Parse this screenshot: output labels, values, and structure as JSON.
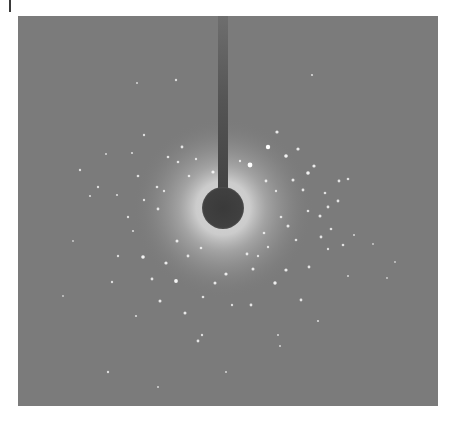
{
  "page": {
    "cropped_caption_fragment": "ᵍ  ʸ ᵍ ʸ ʸ     ᵍ     ᵍ"
  },
  "figure": {
    "type": "diffraction-pattern",
    "colors": {
      "background": "#7b7b7b",
      "halo": "#c8c8c8",
      "beamstop": "#3e3e3e",
      "spot": "#ffffff"
    },
    "beamstop": {
      "cx": 205,
      "cy": 192,
      "r": 20,
      "arm_x": 202,
      "arm_width": 10
    },
    "halo": {
      "inner_r": 22,
      "peak_r": 40,
      "outer_r": 85
    },
    "spots": [
      [
        232,
        149,
        2.4
      ],
      [
        250,
        131,
        2.2
      ],
      [
        268,
        140,
        1.8
      ],
      [
        259,
        116,
        1.6
      ],
      [
        280,
        133,
        1.6
      ],
      [
        290,
        157,
        1.8
      ],
      [
        296,
        150,
        1.6
      ],
      [
        275,
        164,
        1.5
      ],
      [
        188,
        199,
        1.5
      ],
      [
        195,
        156,
        1.6
      ],
      [
        140,
        193,
        1.4
      ],
      [
        126,
        184,
        1.2
      ],
      [
        120,
        160,
        1.3
      ],
      [
        139,
        171,
        1.3
      ],
      [
        146,
        175,
        1.2
      ],
      [
        150,
        141,
        1.3
      ],
      [
        164,
        131,
        1.4
      ],
      [
        171,
        160,
        1.3
      ],
      [
        178,
        143,
        1.2
      ],
      [
        125,
        241,
        1.8
      ],
      [
        148,
        247,
        1.6
      ],
      [
        158,
        265,
        1.9
      ],
      [
        134,
        263,
        1.4
      ],
      [
        142,
        285,
        1.5
      ],
      [
        167,
        297,
        1.5
      ],
      [
        180,
        325,
        1.4
      ],
      [
        197,
        267,
        1.5
      ],
      [
        208,
        258,
        1.6
      ],
      [
        213,
        199,
        1.4
      ],
      [
        235,
        253,
        1.5
      ],
      [
        233,
        289,
        1.4
      ],
      [
        257,
        267,
        1.7
      ],
      [
        268,
        254,
        1.6
      ],
      [
        291,
        251,
        1.4
      ],
      [
        283,
        284,
        1.4
      ],
      [
        302,
        200,
        1.5
      ],
      [
        310,
        191,
        1.4
      ],
      [
        320,
        185,
        1.4
      ],
      [
        303,
        221,
        1.4
      ],
      [
        313,
        213,
        1.3
      ],
      [
        285,
        174,
        1.4
      ],
      [
        290,
        195,
        1.3
      ],
      [
        307,
        177,
        1.3
      ],
      [
        321,
        165,
        1.4
      ],
      [
        330,
        163,
        1.3
      ],
      [
        310,
        233,
        1.2
      ],
      [
        325,
        229,
        1.3
      ],
      [
        270,
        210,
        1.5
      ],
      [
        263,
        201,
        1.3
      ],
      [
        278,
        224,
        1.3
      ],
      [
        62,
        154,
        1.2
      ],
      [
        80,
        171,
        1.2
      ],
      [
        99,
        179,
        1.1
      ],
      [
        72,
        180,
        1.1
      ],
      [
        114,
        137,
        1.1
      ],
      [
        126,
        119,
        1.2
      ],
      [
        207,
        40,
        1.0
      ],
      [
        119,
        67,
        1.0
      ],
      [
        158,
        64,
        1.2
      ],
      [
        294,
        59,
        1.1
      ],
      [
        110,
        201,
        1.2
      ],
      [
        115,
        215,
        1.1
      ],
      [
        100,
        240,
        1.2
      ],
      [
        94,
        266,
        1.2
      ],
      [
        118,
        300,
        1.1
      ],
      [
        90,
        356,
        1.2
      ],
      [
        140,
        371,
        1.0
      ],
      [
        184,
        319,
        1.2
      ],
      [
        208,
        356,
        1.0
      ],
      [
        262,
        330,
        1.0
      ],
      [
        300,
        305,
        1.1
      ],
      [
        260,
        319,
        1.0
      ],
      [
        336,
        219,
        1.0
      ],
      [
        355,
        228,
        0.9
      ],
      [
        369,
        262,
        0.9
      ],
      [
        377,
        246,
        0.9
      ],
      [
        88,
        138,
        1.0
      ],
      [
        55,
        225,
        0.9
      ],
      [
        45,
        280,
        0.9
      ],
      [
        330,
        260,
        1.0
      ],
      [
        159,
        225,
        1.5
      ],
      [
        170,
        240,
        1.4
      ],
      [
        183,
        232,
        1.3
      ],
      [
        229,
        238,
        1.4
      ],
      [
        246,
        217,
        1.3
      ],
      [
        248,
        165,
        1.4
      ],
      [
        240,
        240,
        1.2
      ],
      [
        160,
        146,
        1.3
      ],
      [
        222,
        145,
        1.2
      ],
      [
        258,
        175,
        1.2
      ],
      [
        185,
        281,
        1.3
      ],
      [
        214,
        289,
        1.2
      ],
      [
        250,
        231,
        1.2
      ]
    ]
  }
}
